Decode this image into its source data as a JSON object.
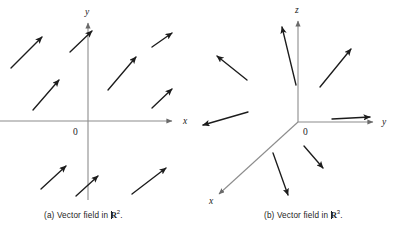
{
  "figure": {
    "background_color": "#ffffff",
    "ink_color": "#1c1c1c",
    "axis_color": "#8c8c8c"
  },
  "panel_a": {
    "caption_prefix": "(a) Vector field in ",
    "caption_symbol": "R",
    "caption_exponent": "2",
    "caption_suffix": ".",
    "caption_full": "(a) Vector field in R2.",
    "axis_labels": {
      "x": "x",
      "y": "y",
      "origin": "0"
    }
  },
  "panel_b": {
    "caption_prefix": "(b) Vector field in ",
    "caption_symbol": "R",
    "caption_exponent": "3",
    "caption_suffix": ".",
    "caption_full": "(b) Vector field in R3.",
    "axis_labels": {
      "x": "x",
      "y": "y",
      "z": "z",
      "origin": "0"
    }
  },
  "chart_data": [
    {
      "type": "quiver",
      "title": "(a) Vector field in R2",
      "xlabel": "x",
      "ylabel": "y",
      "grid": false,
      "legend": null,
      "origin_px": [
        88,
        121
      ],
      "axes_px": {
        "x_axis": [
          0,
          121,
          175,
          121
        ],
        "y_axis": [
          88,
          200,
          88,
          20
        ]
      },
      "description": "Uniform vector field in the plane: every arrow is identical, pointing up and to the right at about 45 degrees.",
      "vectors_px": [
        {
          "x1": 11,
          "y1": 68,
          "x2": 46,
          "y2": 33
        },
        {
          "x1": 70,
          "y1": 52,
          "x2": 95,
          "y2": 28
        },
        {
          "x1": 152,
          "y1": 47,
          "x2": 176,
          "y2": 30
        },
        {
          "x1": 33,
          "y1": 110,
          "x2": 63,
          "y2": 76
        },
        {
          "x1": 108,
          "y1": 90,
          "x2": 140,
          "y2": 53
        },
        {
          "x1": 152,
          "y1": 108,
          "x2": 176,
          "y2": 86
        },
        {
          "x1": 41,
          "y1": 189,
          "x2": 70,
          "y2": 162
        },
        {
          "x1": 76,
          "y1": 196,
          "x2": 102,
          "y2": 172
        },
        {
          "x1": 132,
          "y1": 194,
          "x2": 170,
          "y2": 164
        }
      ]
    },
    {
      "type": "quiver",
      "title": "(b) Vector field in R3",
      "xlabel": "x",
      "ylabel": "y",
      "zlabel": "z",
      "grid": false,
      "legend": null,
      "origin_px": [
        98,
        122
      ],
      "axes_px": {
        "z_axis": [
          98,
          122,
          98,
          18
        ],
        "y_axis": [
          98,
          122,
          176,
          122
        ],
        "x_axis": [
          98,
          122,
          16,
          197
        ]
      },
      "description": "Radial vector field in space: arrows point outward away from the origin in all directions.",
      "vectors_px": [
        {
          "x1": 46,
          "y1": 79,
          "x2": 13,
          "y2": 53
        },
        {
          "x1": 96,
          "y1": 85,
          "x2": 80,
          "y2": 22
        },
        {
          "x1": 120,
          "y1": 87,
          "x2": 155,
          "y2": 44
        },
        {
          "x1": 48,
          "y1": 112,
          "x2": -2,
          "y2": 126
        },
        {
          "x1": 132,
          "y1": 119,
          "x2": 175,
          "y2": 117
        },
        {
          "x1": 104,
          "y1": 146,
          "x2": 126,
          "y2": 172
        },
        {
          "x1": 73,
          "y1": 153,
          "x2": 90,
          "y2": 200
        }
      ]
    }
  ]
}
